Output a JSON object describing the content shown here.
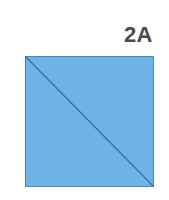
{
  "figure": {
    "label": "2A",
    "shape": "square",
    "divider": "diagonal from top-left to bottom-right",
    "colors": {
      "fill": "#6cb4e8",
      "border": "#4f87b0",
      "diagonal": "#3a6f9a",
      "label": "#4a4a4a",
      "background": "#ffffff"
    }
  }
}
